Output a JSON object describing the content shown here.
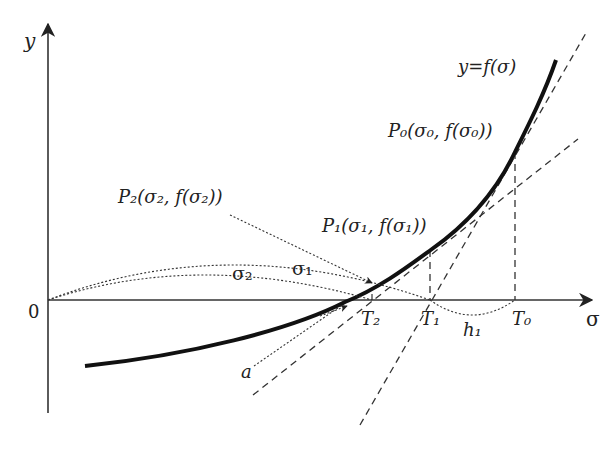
{
  "diagram": {
    "axes": {
      "y_label": "y",
      "x_label": "σ",
      "origin_label": "0"
    },
    "curve_label": "y=f(σ)",
    "points": [
      {
        "id": "P0",
        "label": "P₀(σ₀, f(σ₀))"
      },
      {
        "id": "P1",
        "label": "P₁(σ₁, f(σ₁))"
      },
      {
        "id": "P2",
        "label": "P₂(σ₂, f(σ₂))"
      }
    ],
    "axis_marks": [
      {
        "id": "T2",
        "label": "T₂"
      },
      {
        "id": "T1",
        "label": "T₁"
      },
      {
        "id": "T0",
        "label": "T₀"
      }
    ],
    "arc_labels": {
      "sigma2": "σ₂",
      "sigma1": "σ₁",
      "h1": "h₁",
      "a": "a"
    },
    "colors": {
      "curve": "#111111",
      "axis": "#333333",
      "dashed": "#333333",
      "text": "#222222"
    }
  }
}
